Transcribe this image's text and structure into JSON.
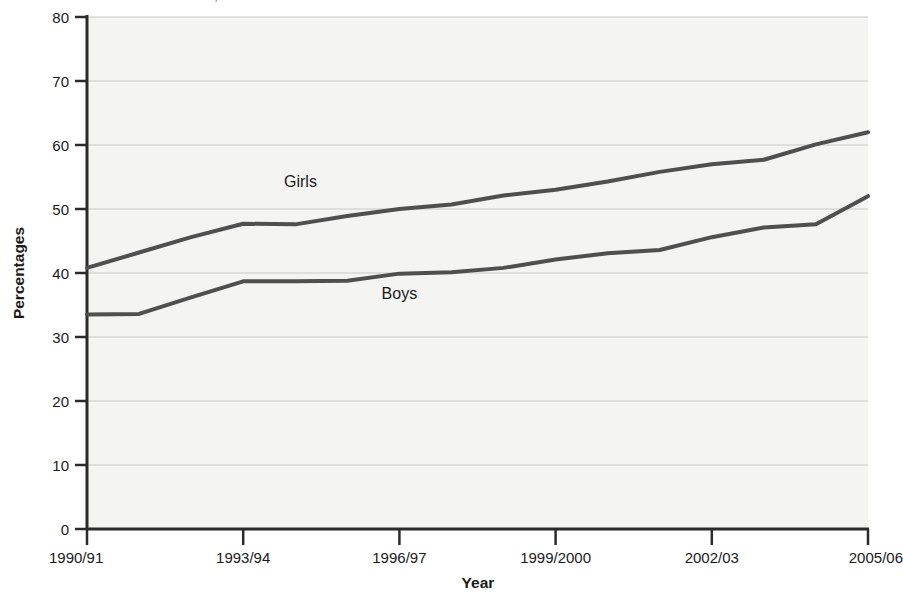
{
  "page": {
    "background_color": "#ffffff",
    "cropped_caption_top": "xxxxxx xxxxxxx xxxxxxxxx, xxxxx xxxxxxx xxx xxxxxxxxxx xxxxxxx"
  },
  "chart_data": {
    "type": "line",
    "title": "",
    "xlabel": "Year",
    "ylabel": "Percentages",
    "ylim": [
      0,
      80
    ],
    "ytick_step": 10,
    "yticks": [
      0,
      10,
      20,
      30,
      40,
      50,
      60,
      70,
      80
    ],
    "grid": true,
    "grid_axis": "y",
    "legend_position": "inline-labels",
    "plot_background": "#f4f4f2",
    "line_color": "#4f4f4f",
    "grid_color": "#c9c9c9",
    "axis_color": "#2b2b2b",
    "x": [
      "1990/91",
      "1991/92",
      "1992/93",
      "1993/94",
      "1994/95",
      "1995/96",
      "1996/97",
      "1997/98",
      "1998/99",
      "1999/2000",
      "2000/01",
      "2001/02",
      "2002/03",
      "2003/04",
      "2004/05",
      "2005/06"
    ],
    "xticks": [
      "1990/91",
      "1993/94",
      "1996/97",
      "1999/2000",
      "2002/03",
      "2005/06"
    ],
    "xtick_indices": [
      0,
      3,
      6,
      9,
      12,
      15
    ],
    "series": [
      {
        "name": "Girls",
        "label": "Girls",
        "color": "#4f4f4f",
        "values": [
          40.8,
          43.2,
          45.6,
          47.7,
          47.6,
          48.9,
          50.0,
          50.7,
          52.1,
          53.0,
          54.3,
          55.8,
          57.0,
          57.7,
          60.1,
          62.0
        ],
        "label_x_index": 4.1,
        "label_y_value": 53.5
      },
      {
        "name": "Boys",
        "label": "Boys",
        "color": "#4f4f4f",
        "values": [
          33.5,
          33.6,
          36.2,
          38.7,
          38.7,
          38.8,
          39.9,
          40.1,
          40.8,
          42.1,
          43.1,
          43.6,
          45.6,
          47.1,
          47.6,
          52.0
        ],
        "label_x_index": 6.0,
        "label_y_value": 36.0
      }
    ]
  },
  "axes": {
    "y_axis_title": "Percentages",
    "x_axis_title": "Year",
    "y_tick_labels": [
      "80",
      "70",
      "60",
      "50",
      "40",
      "30",
      "20",
      "10",
      "0"
    ],
    "x_tick_labels": [
      "1990/91",
      "1993/94",
      "1996/97",
      "1999/2000",
      "2002/03",
      "2005/06"
    ]
  }
}
